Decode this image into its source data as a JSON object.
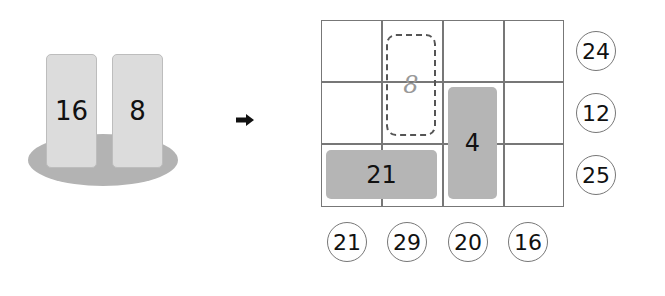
{
  "left_panel": {
    "cards": [
      {
        "label": "16"
      },
      {
        "label": "8"
      }
    ]
  },
  "arrow": {
    "icon": "arrow-right-icon"
  },
  "grid": {
    "rows": 3,
    "cols": 4,
    "blocks": [
      {
        "label": "8",
        "style": "dashed-outline",
        "position": "col 2, rows 1-2"
      },
      {
        "label": "4",
        "style": "filled-gray",
        "position": "col 3, rows 2-3"
      },
      {
        "label": "21",
        "style": "filled-gray",
        "position": "row 3, cols 1-2"
      }
    ]
  },
  "row_sums": [
    "24",
    "12",
    "25"
  ],
  "col_sums": [
    "21",
    "29",
    "20",
    "16"
  ]
}
